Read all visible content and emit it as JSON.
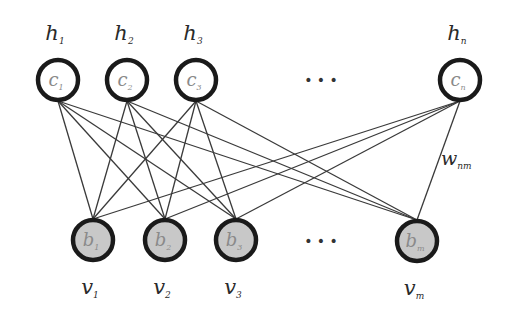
{
  "diagram": {
    "colors": {
      "edge": "#3a3a3a",
      "node_stroke": "#1a1a1a",
      "hidden_fill": "#ffffff",
      "visible_fill": "#c8c8c8",
      "node_text": "#8a8a8a",
      "label_text": "#2a2a2a"
    },
    "hidden_layer": {
      "nodes": [
        {
          "id": "h1",
          "label": "h",
          "label_sub": "1",
          "bias": "c",
          "bias_sub": "1",
          "cx": 58,
          "cy": 80
        },
        {
          "id": "h2",
          "label": "h",
          "label_sub": "2",
          "bias": "c",
          "bias_sub": "2",
          "cx": 127,
          "cy": 80
        },
        {
          "id": "h3",
          "label": "h",
          "label_sub": "3",
          "bias": "c",
          "bias_sub": "3",
          "cx": 196,
          "cy": 80
        },
        {
          "id": "hn",
          "label": "h",
          "label_sub": "n",
          "bias": "c",
          "bias_sub": "n",
          "cx": 460,
          "cy": 80
        }
      ],
      "ellipsis": "• • •"
    },
    "visible_layer": {
      "nodes": [
        {
          "id": "v1",
          "label": "v",
          "label_sub": "1",
          "bias": "b",
          "bias_sub": "1",
          "cx": 93,
          "cy": 240
        },
        {
          "id": "v2",
          "label": "v",
          "label_sub": "2",
          "bias": "b",
          "bias_sub": "2",
          "cx": 165,
          "cy": 240
        },
        {
          "id": "v3",
          "label": "v",
          "label_sub": "3",
          "bias": "b",
          "bias_sub": "3",
          "cx": 236,
          "cy": 240
        },
        {
          "id": "vm",
          "label": "v",
          "label_sub": "m",
          "bias": "b",
          "bias_sub": "m",
          "cx": 417,
          "cy": 241
        }
      ],
      "ellipsis": "• • •"
    },
    "weight_label": {
      "text": "w",
      "sub": "nm"
    },
    "edges": "fully-connected hidden-to-visible"
  }
}
